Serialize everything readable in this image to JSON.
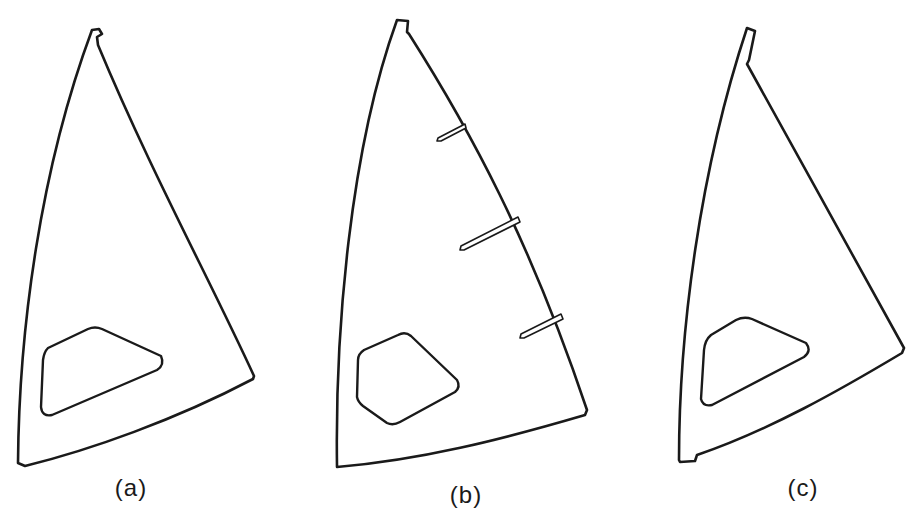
{
  "figure": {
    "stroke_color": "#1a1a1a",
    "background": "#ffffff",
    "panels": [
      {
        "id": "a",
        "label": "(a)",
        "label_pos": [
          131,
          474
        ],
        "outline": "M 92 30 L 99 29 L 102 34 L 97 37 L 98 45 C 150 170, 210 280, 254 376 L 253 379 C 175 420, 90 450, 25 466 L 18 463 C 19 330, 40 170, 92 30 Z",
        "window": "M 48 348 Q 44 352 43 360 L 41 407 Q 42 417 52 415 L 157 370 Q 165 365 161 356 L 102 329 Q 95 326 88 329 Z",
        "battens": []
      },
      {
        "id": "b",
        "label": "(b)",
        "label_pos": [
          466,
          481
        ],
        "outline": "M 397 20 L 408 21 L 407 32 L 409 34 C 470 130, 530 240, 587 410 L 585 415 C 500 440, 420 460, 337 467 C 335 330, 350 150, 397 20 Z",
        "window": "M 364 350 Q 358 354 358 360 L 357 397 Q 358 402 363 406 L 387 423 Q 393 426 400 422 L 455 392 Q 461 387 457 380 L 411 336 Q 405 331 398 335 Z",
        "battens": [
          "M 465 124 L 438 138 L 437 141 L 441 141 L 466 128 Z",
          "M 518 217 L 461 246 L 460 250 L 464 250 L 520 222 Z",
          "M 561 314 L 521 334 L 520 338 L 524 338 L 563 319 Z"
        ]
      },
      {
        "id": "c",
        "label": "(c)",
        "label_pos": [
          803,
          474
        ],
        "outline": "M 747 28 L 755 31 L 749 60 L 747 64 C 800 160, 850 250, 904 348 L 902 353 C 840 390, 770 430, 697 455 L 695 461 L 680 462 L 679 460 C 679 330, 700 170, 747 28 Z",
        "window": "M 711 335 Q 705 340 704 350 L 701 399 Q 703 407 712 405 L 804 357 Q 812 351 806 343 L 752 319 Q 744 316 736 320 Z",
        "battens": []
      }
    ]
  }
}
